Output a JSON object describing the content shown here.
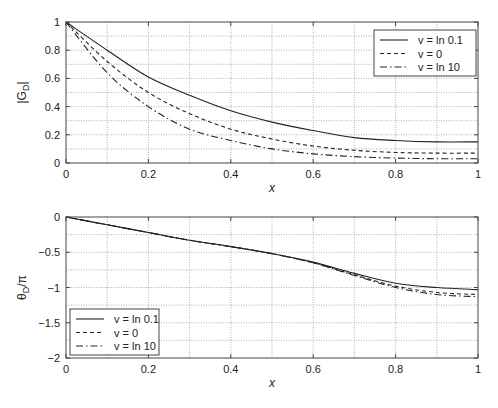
{
  "chart_data": [
    {
      "type": "line",
      "title": "",
      "xlabel": "x",
      "ylabel": "|G_D|",
      "ylabel_main": "|G",
      "ylabel_sub": "D",
      "ylabel_end": "|",
      "xlim": [
        0,
        1
      ],
      "ylim": [
        0,
        1
      ],
      "xticks": [
        0,
        0.2,
        0.4,
        0.6,
        0.8,
        1
      ],
      "xtick_labels": [
        "0",
        "0.2",
        "0.4",
        "0.6",
        "0.8",
        "1"
      ],
      "yticks": [
        0,
        0.2,
        0.4,
        0.6,
        0.8,
        1
      ],
      "ytick_labels": [
        "0",
        "0.2",
        "0.4",
        "0.6",
        "0.8",
        "1"
      ],
      "grid": true,
      "legend_position": "upper right",
      "x": [
        0,
        0.1,
        0.2,
        0.3,
        0.4,
        0.5,
        0.6,
        0.7,
        0.8,
        0.9,
        1.0
      ],
      "series": [
        {
          "name": "v = ln 0.1",
          "style": "solid",
          "values": [
            1,
            0.8,
            0.61,
            0.48,
            0.37,
            0.29,
            0.23,
            0.18,
            0.16,
            0.15,
            0.15
          ]
        },
        {
          "name": "v = 0",
          "style": "dashed",
          "values": [
            1,
            0.72,
            0.5,
            0.35,
            0.24,
            0.17,
            0.12,
            0.09,
            0.075,
            0.07,
            0.07
          ]
        },
        {
          "name": "v = ln 10",
          "style": "dashdot",
          "values": [
            1,
            0.64,
            0.4,
            0.24,
            0.16,
            0.1,
            0.065,
            0.045,
            0.035,
            0.03,
            0.03
          ]
        }
      ]
    },
    {
      "type": "line",
      "title": "",
      "xlabel": "x",
      "ylabel": "θ_D/π",
      "ylabel_main": "θ",
      "ylabel_sub": "D",
      "ylabel_end": "/π",
      "xlim": [
        0,
        1
      ],
      "ylim": [
        -2,
        0
      ],
      "xticks": [
        0,
        0.2,
        0.4,
        0.6,
        0.8,
        1
      ],
      "xtick_labels": [
        "0",
        "0.2",
        "0.4",
        "0.6",
        "0.8",
        "1"
      ],
      "yticks": [
        -2,
        -1.5,
        -1,
        -0.5,
        0
      ],
      "ytick_labels": [
        "−2",
        "−1.5",
        "−1",
        "−0.5",
        "0"
      ],
      "grid": true,
      "legend_position": "lower left",
      "x": [
        0,
        0.1,
        0.2,
        0.3,
        0.4,
        0.5,
        0.6,
        0.7,
        0.8,
        0.9,
        1.0
      ],
      "series": [
        {
          "name": "v = ln 0.1",
          "style": "solid",
          "values": [
            0,
            -0.11,
            -0.22,
            -0.33,
            -0.42,
            -0.52,
            -0.64,
            -0.8,
            -0.94,
            -1.0,
            -1.03
          ]
        },
        {
          "name": "v = 0",
          "style": "dashed",
          "values": [
            0,
            -0.11,
            -0.22,
            -0.33,
            -0.42,
            -0.52,
            -0.65,
            -0.82,
            -0.98,
            -1.07,
            -1.1
          ]
        },
        {
          "name": "v = ln 10",
          "style": "dashdot",
          "values": [
            0,
            -0.11,
            -0.22,
            -0.33,
            -0.42,
            -0.52,
            -0.65,
            -0.83,
            -1.0,
            -1.1,
            -1.13
          ]
        }
      ]
    }
  ],
  "layout": {
    "panels": [
      {
        "left": 66,
        "top": 22,
        "width": 412,
        "height": 141,
        "minor_y_step": 0.1,
        "minor_x_step": 0.1,
        "legend": {
          "x": 374,
          "y": 30,
          "w": 102,
          "h": 46
        },
        "xlabel_y": 192,
        "ylabel_x": 26
      },
      {
        "left": 66,
        "top": 217,
        "width": 412,
        "height": 141,
        "minor_y_step": 0.25,
        "minor_x_step": 0.1,
        "legend": {
          "x": 70,
          "y": 309,
          "w": 89,
          "h": 46
        },
        "xlabel_y": 387,
        "ylabel_x": 26
      }
    ],
    "line_color": "#222222",
    "grid_color": "#9a9a9a",
    "axis_color": "#444444"
  }
}
